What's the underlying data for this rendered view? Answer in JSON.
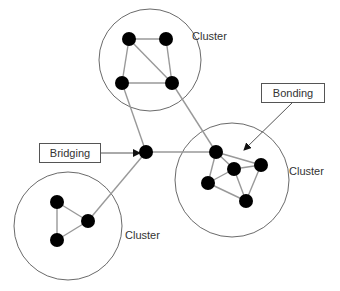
{
  "diagram": {
    "colors": {
      "node": "#000000",
      "edge": "#999999",
      "circle": "#444444",
      "text": "#333333"
    },
    "clusters": [
      {
        "id": "top",
        "label": "Cluster",
        "cx": 150,
        "cy": 60,
        "r": 51
      },
      {
        "id": "right",
        "label": "Cluster",
        "cx": 232,
        "cy": 180,
        "r": 57
      },
      {
        "id": "bottom-left",
        "label": "Cluster",
        "cx": 68,
        "cy": 226,
        "r": 54
      }
    ],
    "labels": {
      "cluster_top": "Cluster",
      "cluster_right": "Cluster",
      "cluster_bottom": "Cluster",
      "bridging": "Bridging",
      "bonding": "Bonding"
    },
    "nodes": [
      {
        "id": "t1",
        "x": 129,
        "y": 39
      },
      {
        "id": "t2",
        "x": 166,
        "y": 39
      },
      {
        "id": "t3",
        "x": 122,
        "y": 83
      },
      {
        "id": "t4",
        "x": 172,
        "y": 83
      },
      {
        "id": "bridge",
        "x": 146,
        "y": 152
      },
      {
        "id": "r1",
        "x": 216,
        "y": 152
      },
      {
        "id": "r2",
        "x": 234,
        "y": 169
      },
      {
        "id": "r3",
        "x": 261,
        "y": 165
      },
      {
        "id": "r4",
        "x": 208,
        "y": 183
      },
      {
        "id": "r5",
        "x": 246,
        "y": 201
      },
      {
        "id": "b1",
        "x": 57,
        "y": 202
      },
      {
        "id": "b2",
        "x": 88,
        "y": 221
      },
      {
        "id": "b3",
        "x": 57,
        "y": 240
      }
    ],
    "edges": [
      [
        "t1",
        "t2"
      ],
      [
        "t1",
        "t3"
      ],
      [
        "t1",
        "t4"
      ],
      [
        "t2",
        "t4"
      ],
      [
        "t3",
        "t4"
      ],
      [
        "t3",
        "bridge"
      ],
      [
        "t4",
        "r1"
      ],
      [
        "bridge",
        "r1"
      ],
      [
        "bridge",
        "b2"
      ],
      [
        "r1",
        "r3"
      ],
      [
        "r1",
        "r4"
      ],
      [
        "r1",
        "r2"
      ],
      [
        "r2",
        "r3"
      ],
      [
        "r2",
        "r4"
      ],
      [
        "r2",
        "r5"
      ],
      [
        "r3",
        "r5"
      ],
      [
        "r4",
        "r5"
      ],
      [
        "b1",
        "b2"
      ],
      [
        "b1",
        "b3"
      ],
      [
        "b2",
        "b3"
      ]
    ]
  }
}
